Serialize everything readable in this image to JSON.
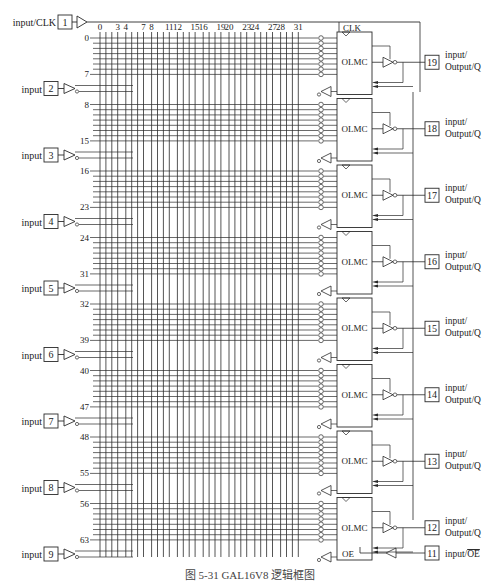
{
  "caption": "图 5-31  GAL16V8 逻辑框图",
  "column_labels": [
    "0",
    "3",
    "4",
    "7",
    "8",
    "11",
    "12",
    "15",
    "16",
    "19",
    "20",
    "23",
    "24",
    "27",
    "28",
    "31"
  ],
  "column_count": 32,
  "clk_pin": {
    "number": "1",
    "label": "input/CLK"
  },
  "clk_label": "CLK",
  "oe_label": "OE",
  "input_pins": [
    {
      "number": "2",
      "label": "input"
    },
    {
      "number": "3",
      "label": "input"
    },
    {
      "number": "4",
      "label": "input"
    },
    {
      "number": "5",
      "label": "input"
    },
    {
      "number": "6",
      "label": "input"
    },
    {
      "number": "7",
      "label": "input"
    },
    {
      "number": "8",
      "label": "input"
    },
    {
      "number": "9",
      "label": "input"
    }
  ],
  "olmc_blocks": [
    {
      "label": "OLMC",
      "first_row": "0",
      "last_row": "7",
      "pin": "19",
      "pin_label_1": "input/",
      "pin_label_2": "Output/Q"
    },
    {
      "label": "OLMC",
      "first_row": "8",
      "last_row": "15",
      "pin": "18",
      "pin_label_1": "input/",
      "pin_label_2": "Output/Q"
    },
    {
      "label": "OLMC",
      "first_row": "16",
      "last_row": "23",
      "pin": "17",
      "pin_label_1": "input/",
      "pin_label_2": "Output/Q"
    },
    {
      "label": "OLMC",
      "first_row": "24",
      "last_row": "31",
      "pin": "16",
      "pin_label_1": "input/",
      "pin_label_2": "Output/Q"
    },
    {
      "label": "OLMC",
      "first_row": "32",
      "last_row": "39",
      "pin": "15",
      "pin_label_1": "input/",
      "pin_label_2": "Output/Q"
    },
    {
      "label": "OLMC",
      "first_row": "40",
      "last_row": "47",
      "pin": "14",
      "pin_label_1": "input/",
      "pin_label_2": "Output/Q"
    },
    {
      "label": "OLMC",
      "first_row": "48",
      "last_row": "55",
      "pin": "13",
      "pin_label_1": "input/",
      "pin_label_2": "Output/Q"
    },
    {
      "label": "OLMC",
      "first_row": "56",
      "last_row": "63",
      "pin": "12",
      "pin_label_1": "input/",
      "pin_label_2": "Output/Q"
    }
  ],
  "oe_pin": {
    "number": "11",
    "label": "input/",
    "label_overlined": "OE"
  },
  "colors": {
    "line": "#2a2a2a",
    "background": "#ffffff"
  }
}
